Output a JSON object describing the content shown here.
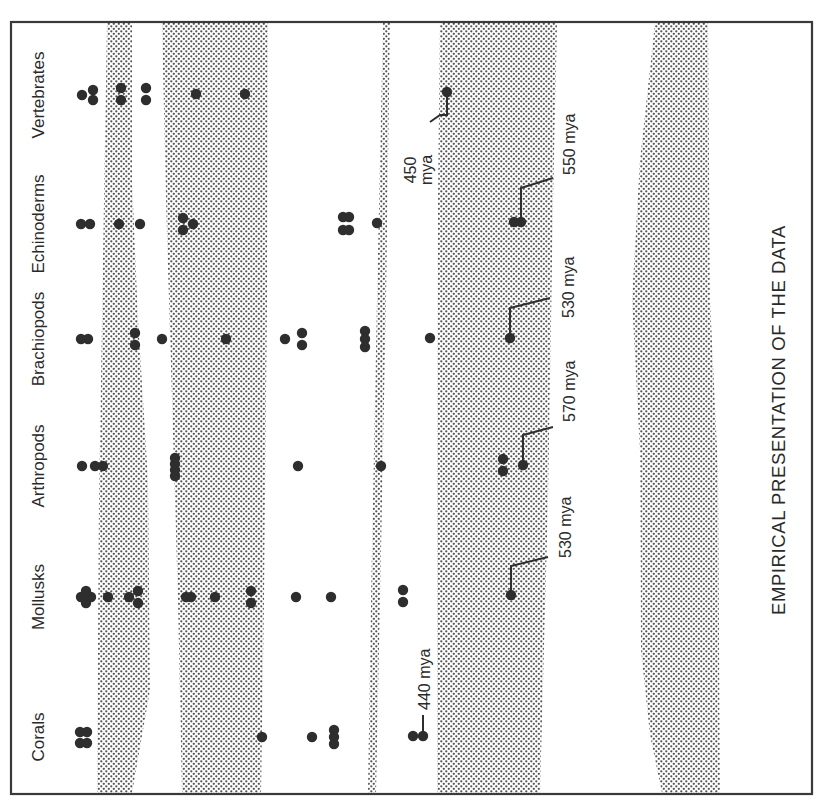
{
  "title": "EMPIRICAL PRESENTATION OF THE DATA",
  "colors": {
    "ink": "#2e2e2e",
    "frame": "#3a3a3a",
    "band_dot": "#555555",
    "background": "#ffffff"
  },
  "frame": {
    "x": 11,
    "y": 22,
    "width": 801,
    "height": 772
  },
  "groups": [
    {
      "name": "Vertebrates",
      "row_y": 95,
      "label_x": 40
    },
    {
      "name": "Echinoderms",
      "row_y": 224,
      "label_x": 40
    },
    {
      "name": "Brachiopods",
      "row_y": 339,
      "label_x": 40
    },
    {
      "name": "Arthropods",
      "row_y": 466,
      "label_x": 40
    },
    {
      "name": "Mollusks",
      "row_y": 597,
      "label_x": 40
    },
    {
      "name": "Corals",
      "row_y": 737,
      "label_x": 40
    }
  ],
  "bands": [
    {
      "name": "band-1",
      "points": "107,23 132,23 132,180 138,320 148,480 150,690 132,793 97,793 99,500 104,200"
    },
    {
      "name": "band-2",
      "points": "162,23 268,23 267,300 264,600 261,793 182,793 178,600 172,400 166,200"
    },
    {
      "name": "band-3",
      "points": "383,23 390,23 386,300 380,600 376,793 368,793 371,600 377,300"
    },
    {
      "name": "band-4",
      "points": "440,23 557,23 553,200 548,500 540,793 437,793 437,500 438,200"
    },
    {
      "name": "band-5",
      "points": "655,23 708,23 710,300 718,470 720,793 662,793 650,735 641,650 640,450 632,300 640,160"
    }
  ],
  "dots": [
    {
      "x": 82,
      "y": 95
    },
    {
      "x": 93,
      "y": 90
    },
    {
      "x": 93,
      "y": 100
    },
    {
      "x": 121,
      "y": 88
    },
    {
      "x": 121,
      "y": 100
    },
    {
      "x": 146,
      "y": 88
    },
    {
      "x": 146,
      "y": 100
    },
    {
      "x": 196,
      "y": 94
    },
    {
      "x": 245,
      "y": 94
    },
    {
      "x": 447,
      "y": 92
    },
    {
      "x": 81,
      "y": 224
    },
    {
      "x": 90,
      "y": 224
    },
    {
      "x": 119,
      "y": 224
    },
    {
      "x": 140,
      "y": 224
    },
    {
      "x": 183,
      "y": 218
    },
    {
      "x": 193,
      "y": 224
    },
    {
      "x": 183,
      "y": 230
    },
    {
      "x": 343,
      "y": 217
    },
    {
      "x": 349,
      "y": 217
    },
    {
      "x": 343,
      "y": 230
    },
    {
      "x": 349,
      "y": 230
    },
    {
      "x": 377,
      "y": 223
    },
    {
      "x": 514,
      "y": 222
    },
    {
      "x": 521,
      "y": 222
    },
    {
      "x": 81,
      "y": 339
    },
    {
      "x": 88,
      "y": 339
    },
    {
      "x": 135,
      "y": 333
    },
    {
      "x": 135,
      "y": 345
    },
    {
      "x": 162,
      "y": 339
    },
    {
      "x": 226,
      "y": 339
    },
    {
      "x": 285,
      "y": 339
    },
    {
      "x": 302,
      "y": 333
    },
    {
      "x": 302,
      "y": 345
    },
    {
      "x": 365,
      "y": 331
    },
    {
      "x": 365,
      "y": 339
    },
    {
      "x": 365,
      "y": 347
    },
    {
      "x": 430,
      "y": 338
    },
    {
      "x": 510,
      "y": 338
    },
    {
      "x": 82,
      "y": 466
    },
    {
      "x": 95,
      "y": 466
    },
    {
      "x": 103,
      "y": 466
    },
    {
      "x": 175,
      "y": 458
    },
    {
      "x": 175,
      "y": 464
    },
    {
      "x": 175,
      "y": 470
    },
    {
      "x": 175,
      "y": 476
    },
    {
      "x": 298,
      "y": 466
    },
    {
      "x": 381,
      "y": 466
    },
    {
      "x": 503,
      "y": 459
    },
    {
      "x": 503,
      "y": 471
    },
    {
      "x": 523,
      "y": 465
    },
    {
      "x": 81,
      "y": 597
    },
    {
      "x": 86,
      "y": 591
    },
    {
      "x": 86,
      "y": 603
    },
    {
      "x": 91,
      "y": 597
    },
    {
      "x": 108,
      "y": 597
    },
    {
      "x": 129,
      "y": 597
    },
    {
      "x": 138,
      "y": 591
    },
    {
      "x": 138,
      "y": 603
    },
    {
      "x": 186,
      "y": 597
    },
    {
      "x": 191,
      "y": 597
    },
    {
      "x": 215,
      "y": 597
    },
    {
      "x": 251,
      "y": 591
    },
    {
      "x": 251,
      "y": 603
    },
    {
      "x": 296,
      "y": 597
    },
    {
      "x": 331,
      "y": 597
    },
    {
      "x": 403,
      "y": 590
    },
    {
      "x": 403,
      "y": 602
    },
    {
      "x": 511,
      "y": 595
    },
    {
      "x": 80,
      "y": 732
    },
    {
      "x": 87,
      "y": 732
    },
    {
      "x": 80,
      "y": 743
    },
    {
      "x": 87,
      "y": 743
    },
    {
      "x": 262,
      "y": 737
    },
    {
      "x": 312,
      "y": 737
    },
    {
      "x": 334,
      "y": 730
    },
    {
      "x": 334,
      "y": 737
    },
    {
      "x": 334,
      "y": 744
    },
    {
      "x": 413,
      "y": 736
    },
    {
      "x": 423,
      "y": 736
    }
  ],
  "annotations": [
    {
      "label": "450",
      "label2": "mya",
      "dot": {
        "x": 447,
        "y": 92
      },
      "path": "447,92 447,115 440,115 430,122",
      "text_x": 416,
      "text_y": 170,
      "two_line": true
    },
    {
      "label": "550 mya",
      "dot": {
        "x": 521,
        "y": 222
      },
      "path": "521,222 521,188 553,178",
      "text_x": 575,
      "text_y": 175
    },
    {
      "label": "530 mya",
      "dot": {
        "x": 510,
        "y": 338
      },
      "path": "510,338 510,308 550,298",
      "text_x": 574,
      "text_y": 318
    },
    {
      "label": "570 mya",
      "dot": {
        "x": 523,
        "y": 465
      },
      "path": "523,465 523,435 553,427",
      "text_x": 575,
      "text_y": 422
    },
    {
      "label": "530 mya",
      "dot": {
        "x": 511,
        "y": 595
      },
      "path": "511,595 511,566 548,557",
      "text_x": 571,
      "text_y": 558
    },
    {
      "label": "440 mya",
      "dot": {
        "x": 423,
        "y": 736
      },
      "path": "423,736 423,715",
      "text_x": 430,
      "text_y": 710
    }
  ]
}
